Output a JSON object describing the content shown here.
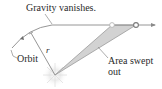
{
  "diagram": {
    "labels": {
      "gravity": "Gravity vanishes.",
      "orbit": "Orbit",
      "radius": "r",
      "area_line1": "Area swept",
      "area_line2": "out"
    },
    "colors": {
      "line": "#8a8a8a",
      "shade": "#cfcfcf",
      "shade_edge": "#9a9a9a",
      "sun_glow": "#e8e8e8",
      "text": "#2a2a2a"
    }
  }
}
